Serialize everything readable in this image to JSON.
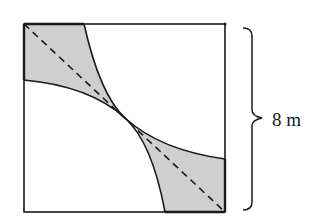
{
  "figure": {
    "type": "geometry-diagram",
    "square": {
      "side_label": "8 m"
    },
    "dimension_label": "8 m",
    "colors": {
      "stroke": "#1a1a1a",
      "shade": "#cfcfcf",
      "background": "#ffffff"
    },
    "elements": {
      "shaded_regions": [
        "top-left corner region",
        "bottom-right corner region"
      ],
      "arcs": [
        "quarter circle centered at bottom-left corner",
        "quarter circle centered at top-right corner"
      ],
      "dashed_line": "diagonal from top-left to bottom-right corner"
    }
  }
}
